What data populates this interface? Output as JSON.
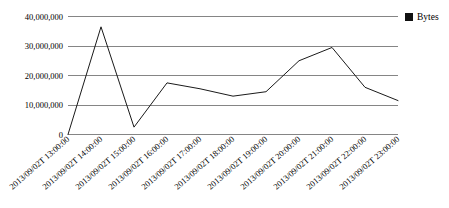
{
  "chart_data": {
    "type": "line",
    "title": "",
    "subtitle": "",
    "xlabel": "",
    "ylabel": "",
    "grid": true,
    "legend_position": "top-right",
    "categories": [
      "2013/09/02T 13:00:00",
      "2013/09/02T 14:00:00",
      "2013/09/02T 15:00:00",
      "2013/09/02T 16:00:00",
      "2013/09/02T 17:00:00",
      "2013/09/02T 18:00:00",
      "2013/09/02T 19:00:00",
      "2013/09/02T 20:00:00",
      "2013/09/02T 21:00:00",
      "2013/09/02T 22:00:00",
      "2013/09/02T 23:00:00"
    ],
    "series": [
      {
        "name": "Bytes",
        "color": "#1a1a1a",
        "values": [
          0,
          36500000,
          2500000,
          17500000,
          15500000,
          13000000,
          14500000,
          25000000,
          29500000,
          16000000,
          11500000
        ]
      }
    ],
    "ylim": [
      0,
      40000000
    ],
    "ytick_values": [
      0,
      10000000,
      20000000,
      30000000,
      40000000
    ],
    "ytick_labels": [
      "0",
      "10,000,000",
      "20,000,000",
      "30,000,000",
      "40,000,000"
    ]
  },
  "legend": {
    "entries": [
      {
        "label": "Bytes",
        "marker": "filled-square",
        "color": "#111111"
      }
    ]
  }
}
